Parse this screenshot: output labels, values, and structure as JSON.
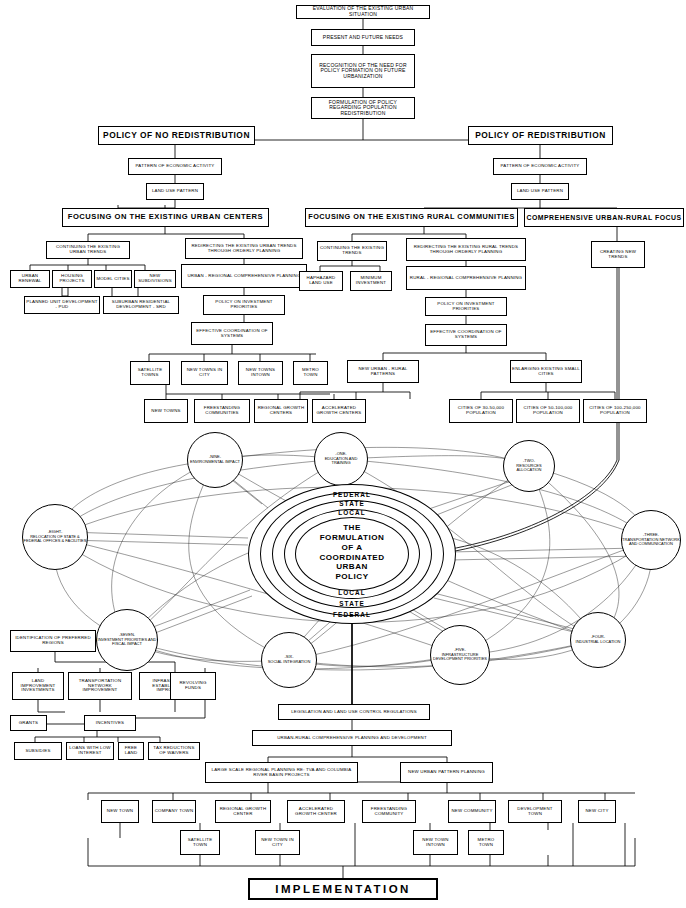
{
  "diagram": {
    "title": "The Formulation of a Coordinated Urban Policy",
    "implementation_label": "IMPLEMENTATION"
  },
  "top_chain": [
    {
      "id": "eval",
      "label": "EVALUATION OF THE EXISTING URBAN SITUATION"
    },
    {
      "id": "needs",
      "label": "PRESENT AND FUTURE NEEDS"
    },
    {
      "id": "recog",
      "label": "RECOGNITION OF THE NEED FOR POLICY FORMATION ON FUTURE URBANIZATION"
    },
    {
      "id": "form",
      "label": "FORMULATION OF POLICY REGARDING POPULATION REDISTRIBUTION"
    }
  ],
  "policies": {
    "no_redistribution": "POLICY OF NO REDISTRIBUTION",
    "redistribution": "POLICY OF REDISTRIBUTION",
    "pattern_left": "PATTERN OF ECONOMIC ACTIVITY",
    "pattern_right": "PATTERN OF ECONOMIC ACTIVITY",
    "land_use_left": "LAND USE PATTERN",
    "land_use_right": "LAND USE PATTERN"
  },
  "focus_headers": {
    "urban_centers": "FOCUSING ON THE EXISTING URBAN CENTERS",
    "rural_communities": "FOCUSING ON THE EXISTING RURAL COMMUNITIES",
    "comprehensive": "COMPREHENSIVE URBAN-RURAL FOCUS"
  },
  "urban_branch": {
    "continuing": "CONTINUING THE EXISTING URBAN TRENDS",
    "children": [
      "URBAN RENEWAL",
      "HOUSING PROJECTS",
      "MODEL CITIES",
      "NEW SUBDIVISIONS"
    ],
    "pud": "PLANNED UNIT DEVELOPMENT - PUD",
    "srd": "SUBURBAN RESIDENTIAL DEVELOPMENT - SRD",
    "redirecting": "REDIRECTING THE EXISTING URBAN TRENDS THROUGH ORDERLY PLANNING",
    "urban_regional": "URBAN - REGIONAL COMPREHENSIVE PLANNING",
    "policy_investment": "POLICY ON INVESTMENT PRIORITIES",
    "effective_coord": "EFFECTIVE COORDINATION OF SYSTEMS",
    "outputs": [
      "SATELLITE TOWNS",
      "NEW TOWNS IN CITY",
      "NEW TOWNS INTOWN",
      "METRO TOWN"
    ],
    "outputs2": [
      "NEW TOWNS",
      "FREESTANDING COMMUNITIES",
      "REGIONAL GROWTH CENTERS",
      "ACCELERATED GROWTH CENTERS"
    ]
  },
  "rural_branch": {
    "continuing": "CONTINUING THE EXISTING TRENDS",
    "children": [
      "HAPHAZARD LAND USE",
      "MINIMUM INVESTMENT"
    ],
    "redirecting": "REDIRECTING THE EXISTING RURAL TRENDS THROUGH ORDERLY PLANNING",
    "rural_regional": "RURAL - REGIONAL COMPREHENSIVE PLANNING",
    "policy_investment": "POLICY ON INVESTMENT PRIORITIES",
    "effective_coord": "EFFECTIVE COORDINATION OF SYSTEMS",
    "new_patterns": "NEW URBAN - RURAL PATTERNS",
    "enlarging": "ENLARGING EXISTING SMALL CITIES",
    "cities": [
      "CITIES OF 30-50,000 POPULATION",
      "CITIES OF 50-100,000 POPULATION",
      "CITIES OF 100-250,000 POPULATION"
    ]
  },
  "comprehensive_branch": {
    "creating": "CREATING NEW TRENDS"
  },
  "core": {
    "rings": [
      "FEDERAL",
      "STATE",
      "LOCAL"
    ],
    "rings_bottom": [
      "LOCAL",
      "STATE",
      "FEDERAL"
    ],
    "text_lines": [
      "THE",
      "FORMULATION",
      "OF  A",
      "COORDINATED",
      "URBAN",
      "POLICY"
    ]
  },
  "factors": [
    {
      "num": "-ONE-",
      "label": "EDUCATION AND TRAINING"
    },
    {
      "num": "-TWO-",
      "label": "RESOURCES ALLOCATION"
    },
    {
      "num": "-THREE-",
      "label": "TRANSPORTATION NETWORK AND COMMUNICATION"
    },
    {
      "num": "-FOUR-",
      "label": "INDUSTRIAL LOCATION"
    },
    {
      "num": "-FIVE-",
      "label": "INFRASTRUCTURE DEVELOPMENT PRIORITIES"
    },
    {
      "num": "-SIX-",
      "label": "SOCIAL INTEGRATION"
    },
    {
      "num": "-SEVEN-",
      "label": "INVESTMENT PRIORITIES AND FISCAL IMPACT"
    },
    {
      "num": "-EIGHT-",
      "label": "RELOCATION OF STATE & FEDERAL OFFICES & FACILITIES"
    },
    {
      "num": "-NINE-",
      "label": "ENVIRONMENTAL IMPACT"
    }
  ],
  "incentive_branch": {
    "identification": "IDENTIFICATION OF PREFERRED REGIONS",
    "instruments": [
      "LAND IMPROVEMENT INVESTMENTS",
      "TRANSPORTATION NETWORK IMPROVEMENT",
      "INFRASTRUCTURE ESTABLISHMENT & IMPROVEMENT",
      "REVOLVING FUNDS"
    ],
    "grants": "GRANTS",
    "incentives": "INCENTIVES",
    "incentive_types": [
      "SUBSIDIES",
      "LOANS WITH LOW INTEREST",
      "FREE LAND",
      "TAX REDUCTIONS OF WAIVERS"
    ]
  },
  "implementation_chain": {
    "legislation": "LEGISLATION AND LAND USE CONTROL REGULATIONS",
    "urban_rural": "URBAN-RURAL COMPREHENSIVE PLANNING AND DEVELOPMENT",
    "large_scale": "LARGE SCALE REGIONAL PLANNING RE: TVA AND COLUMBIA RIVER BASIN PROJECTS",
    "new_urban_pattern": "NEW URBAN PATTERN PLANNING",
    "outcomes": [
      "NEW TOWN",
      "COMPANY TOWN",
      "REGIONAL GROWTH CENTER",
      "ACCELERATED GROWTH CENTER",
      "FREESTANDING COMMUNITY",
      "NEW COMMUNITY",
      "DEVELOPMENT TOWN",
      "NEW CITY"
    ],
    "sub_outcomes": [
      "SATELLITE TOWN",
      "NEW TOWN IN CITY",
      "NEW TOWN INTOWN",
      "METRO TOWN"
    ]
  }
}
